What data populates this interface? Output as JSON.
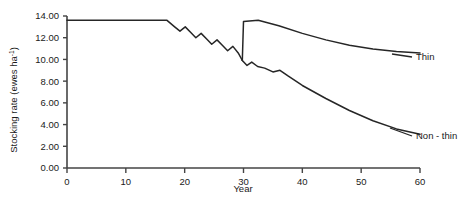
{
  "chart_data": {
    "type": "line",
    "title": "",
    "xlabel": "Year",
    "ylabel": "Stocking rate (ewes ha",
    "ylabel_sup": "-1",
    "ylabel_tail": ")",
    "xlim": [
      0,
      60
    ],
    "ylim": [
      0,
      14
    ],
    "grid": false,
    "legend_position": "inline-right-labels",
    "xticks": [
      0,
      10,
      20,
      30,
      40,
      50,
      60
    ],
    "xtick_labels": [
      "0",
      "10",
      "20",
      "30",
      "40",
      "50",
      "60"
    ],
    "yticks": [
      0,
      2,
      4,
      6,
      8,
      10,
      12,
      14
    ],
    "ytick_labels": [
      "0.00",
      "2.00",
      "4.00",
      "6.00",
      "8.00",
      "10.00",
      "12.00",
      "14.00"
    ],
    "series": [
      {
        "name": "Common",
        "label": "",
        "color": "#262626",
        "points": [
          [
            0,
            13.6
          ],
          [
            17,
            13.6
          ],
          [
            18.3,
            13.0
          ],
          [
            19.2,
            12.6
          ],
          [
            20.1,
            13.0
          ],
          [
            21.0,
            12.5
          ],
          [
            21.9,
            12.0
          ],
          [
            22.8,
            12.4
          ],
          [
            23.7,
            11.9
          ],
          [
            24.6,
            11.4
          ],
          [
            25.5,
            11.8
          ],
          [
            26.4,
            11.3
          ],
          [
            27.3,
            10.8
          ],
          [
            28.2,
            11.2
          ],
          [
            29.1,
            10.6
          ],
          [
            29.8,
            9.9
          ]
        ]
      },
      {
        "name": "Thin",
        "label": "Thin",
        "color": "#262626",
        "points": [
          [
            29.8,
            9.9
          ],
          [
            30.0,
            13.5
          ],
          [
            32.5,
            13.6
          ],
          [
            36,
            13.1
          ],
          [
            40,
            12.4
          ],
          [
            44,
            11.8
          ],
          [
            48,
            11.3
          ],
          [
            52,
            10.95
          ],
          [
            56,
            10.72
          ],
          [
            60,
            10.6
          ]
        ]
      },
      {
        "name": "Non - thin",
        "label": "Non - thin",
        "color": "#262626",
        "points": [
          [
            29.8,
            9.9
          ],
          [
            30.6,
            9.45
          ],
          [
            31.4,
            9.75
          ],
          [
            32.4,
            9.35
          ],
          [
            33.6,
            9.2
          ],
          [
            35.0,
            8.85
          ],
          [
            36.2,
            9.0
          ],
          [
            37.5,
            8.5
          ],
          [
            40,
            7.6
          ],
          [
            44,
            6.4
          ],
          [
            48,
            5.3
          ],
          [
            52,
            4.35
          ],
          [
            56,
            3.6
          ],
          [
            60,
            3.1
          ]
        ]
      }
    ],
    "annotations": [
      {
        "text": "Thin",
        "x_px": 416,
        "y_px": 57,
        "leader_from_px": [
          392,
          54
        ],
        "leader_to_px": [
          412,
          57
        ]
      },
      {
        "text": "Non - thin",
        "x_px": 416,
        "y_px": 136,
        "leader_from_px": [
          390,
          128
        ],
        "leader_to_px": [
          412,
          136
        ]
      }
    ]
  }
}
